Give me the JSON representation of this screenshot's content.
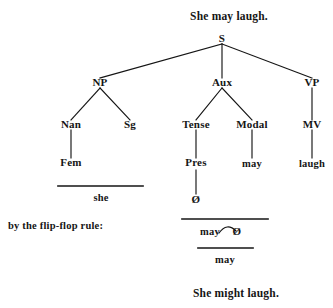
{
  "diagram": {
    "type": "syntax-tree-derivation",
    "title_top": "She may laugh.",
    "title_bottom": "She might laugh.",
    "annotation": "by the flip-flop rule:",
    "nodes": {
      "s": "S",
      "np": "NP",
      "aux": "Aux",
      "vp": "VP",
      "nan": "Nan",
      "sg": "Sg",
      "tense": "Tense",
      "modal": "Modal",
      "mv": "MV",
      "fem": "Fem",
      "pres": "Pres",
      "may_modal": "may",
      "laugh": "laugh",
      "null_1": "Ø",
      "she": "she",
      "may_flip": "may",
      "null_2": "Ø",
      "may_final": "may"
    },
    "edges": [
      {
        "from": "S",
        "to": "NP"
      },
      {
        "from": "S",
        "to": "Aux"
      },
      {
        "from": "S",
        "to": "VP"
      },
      {
        "from": "NP",
        "to": "Nan"
      },
      {
        "from": "NP",
        "to": "Sg"
      },
      {
        "from": "Aux",
        "to": "Tense"
      },
      {
        "from": "Aux",
        "to": "Modal"
      },
      {
        "from": "VP",
        "to": "MV"
      },
      {
        "from": "Nan",
        "to": "Fem"
      },
      {
        "from": "Tense",
        "to": "Pres"
      },
      {
        "from": "Modal",
        "to": "may"
      },
      {
        "from": "MV",
        "to": "laugh"
      },
      {
        "from": "Pres",
        "to": "Ø"
      }
    ],
    "swap_arc": {
      "left": "may",
      "right": "Ø"
    },
    "ink_color": "#151515"
  }
}
